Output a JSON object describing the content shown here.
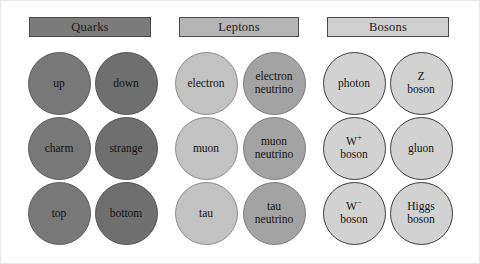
{
  "figure": {
    "background_color": "#ffffff",
    "border_color": "#e8e8e8",
    "text_color": "#141414"
  },
  "headers": [
    {
      "name": "quarks",
      "label": "Quarks",
      "color": "#7b7b7b",
      "x": 28,
      "y": 16,
      "w": 122,
      "h": 20
    },
    {
      "name": "leptons",
      "label": "Leptons",
      "color": "#b5b5b5",
      "x": 178,
      "y": 16,
      "w": 120,
      "h": 20
    },
    {
      "name": "bosons",
      "label": "Bosons",
      "color": "#d0d0d0",
      "x": 326,
      "y": 16,
      "w": 122,
      "h": 20
    }
  ],
  "columns": [
    {
      "index": 0,
      "group": "quarks",
      "style": "g-quark",
      "cx": 58
    },
    {
      "index": 1,
      "group": "quarks",
      "style": "g-quark-dark",
      "cx": 125
    },
    {
      "index": 2,
      "group": "leptons",
      "style": "g-lepton",
      "cx": 205
    },
    {
      "index": 3,
      "group": "leptons",
      "style": "g-lepton-nu",
      "cx": 273
    },
    {
      "index": 4,
      "group": "bosons",
      "style": "g-boson",
      "cx": 353
    },
    {
      "index": 5,
      "group": "bosons",
      "style": "g-boson",
      "cx": 420
    }
  ],
  "rows": [
    {
      "index": 0,
      "cy": 82
    },
    {
      "index": 1,
      "cy": 147
    },
    {
      "index": 2,
      "cy": 212
    }
  ],
  "circle_diameter": 63,
  "particles": [
    {
      "id": "up",
      "label": "up",
      "group": "quarks",
      "column": 0,
      "row": 0,
      "style": "g-quark",
      "cx": 58,
      "cy": 82,
      "html": "up"
    },
    {
      "id": "down",
      "label": "down",
      "group": "quarks",
      "column": 1,
      "row": 0,
      "style": "g-quark-dark",
      "cx": 125,
      "cy": 82,
      "html": "down"
    },
    {
      "id": "electron",
      "label": "electron",
      "group": "leptons",
      "column": 2,
      "row": 0,
      "style": "g-lepton",
      "cx": 205,
      "cy": 82,
      "html": "electron"
    },
    {
      "id": "electron-neutrino",
      "label": "electron neutrino",
      "group": "leptons",
      "column": 3,
      "row": 0,
      "style": "g-lepton-nu",
      "cx": 273,
      "cy": 82,
      "html": "electron<br>neutrino"
    },
    {
      "id": "photon",
      "label": "photon",
      "group": "bosons",
      "column": 4,
      "row": 0,
      "style": "g-boson",
      "cx": 353,
      "cy": 82,
      "html": "photon"
    },
    {
      "id": "z-boson",
      "label": "Z boson",
      "group": "bosons",
      "column": 5,
      "row": 0,
      "style": "g-boson",
      "cx": 420,
      "cy": 82,
      "html": "Z<br>boson"
    },
    {
      "id": "charm",
      "label": "charm",
      "group": "quarks",
      "column": 0,
      "row": 1,
      "style": "g-quark",
      "cx": 58,
      "cy": 147,
      "html": "charm"
    },
    {
      "id": "strange",
      "label": "strange",
      "group": "quarks",
      "column": 1,
      "row": 1,
      "style": "g-quark-dark",
      "cx": 125,
      "cy": 147,
      "html": "strange"
    },
    {
      "id": "muon",
      "label": "muon",
      "group": "leptons",
      "column": 2,
      "row": 1,
      "style": "g-lepton",
      "cx": 205,
      "cy": 147,
      "html": "muon"
    },
    {
      "id": "muon-neutrino",
      "label": "muon neutrino",
      "group": "leptons",
      "column": 3,
      "row": 1,
      "style": "g-lepton-nu",
      "cx": 273,
      "cy": 147,
      "html": "muon<br>neutrino"
    },
    {
      "id": "w-plus-boson",
      "label": "W+ boson",
      "group": "bosons",
      "column": 4,
      "row": 1,
      "style": "g-boson",
      "cx": 353,
      "cy": 147,
      "html": "W<sup>+</sup><br>boson"
    },
    {
      "id": "gluon",
      "label": "gluon",
      "group": "bosons",
      "column": 5,
      "row": 1,
      "style": "g-boson",
      "cx": 420,
      "cy": 147,
      "html": "gluon"
    },
    {
      "id": "top",
      "label": "top",
      "group": "quarks",
      "column": 0,
      "row": 2,
      "style": "g-quark",
      "cx": 58,
      "cy": 212,
      "html": "top"
    },
    {
      "id": "bottom",
      "label": "bottom",
      "group": "quarks",
      "column": 1,
      "row": 2,
      "style": "g-quark-dark",
      "cx": 125,
      "cy": 212,
      "html": "bottom"
    },
    {
      "id": "tau",
      "label": "tau",
      "group": "leptons",
      "column": 2,
      "row": 2,
      "style": "g-lepton",
      "cx": 205,
      "cy": 212,
      "html": "tau"
    },
    {
      "id": "tau-neutrino",
      "label": "tau neutrino",
      "group": "leptons",
      "column": 3,
      "row": 2,
      "style": "g-lepton-nu",
      "cx": 273,
      "cy": 212,
      "html": "tau<br>neutrino"
    },
    {
      "id": "w-minus-boson",
      "label": "W− boson",
      "group": "bosons",
      "column": 4,
      "row": 2,
      "style": "g-boson",
      "cx": 353,
      "cy": 212,
      "html": "W<sup>−</sup><br>boson"
    },
    {
      "id": "higgs-boson",
      "label": "Higgs boson",
      "group": "bosons",
      "column": 5,
      "row": 2,
      "style": "g-boson",
      "cx": 420,
      "cy": 212,
      "html": "Higgs<br>boson"
    }
  ]
}
